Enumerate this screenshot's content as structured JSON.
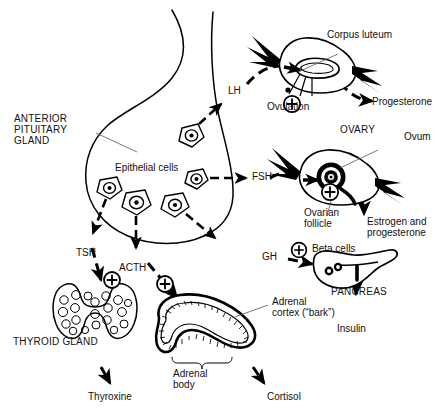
{
  "figure": {
    "type": "biological-flow-diagram",
    "background_color": "#ffffff",
    "ink_color": "#000000"
  },
  "labels": {
    "anterior_pituitary": "ANTERIOR\nPITUITARY\nGLAND",
    "epithelial_cells": "Epithelial cells",
    "lh": "LH",
    "fsh": "FSH",
    "gh": "GH",
    "tsh": "TSH",
    "acth": "ACTH",
    "corpus_luteum": "Corpus luteum",
    "ovulation": "Ovulation",
    "progesterone": "Progesterone",
    "ovary": "OVARY",
    "ovum": "Ovum",
    "ovarian_follicle": "Ovarian\nfollicle",
    "estrogen_and_progesterone": "Estrogen and\nprogesterone",
    "beta_cells": "Beta cells",
    "pancreas": "PANCREAS",
    "insulin": "Insulin",
    "thyroid_gland": "THYROID GLAND",
    "thyroxine": "Thyroxine",
    "adrenal_cortex": "Adrenal\ncortex (“bark”)",
    "adrenal_body": "Adrenal\nbody",
    "cortisol": "Cortisol",
    "plus_sign": "+"
  },
  "hormones": [
    {
      "name": "LH",
      "target": "Corpus luteum / ovary",
      "product": "Progesterone"
    },
    {
      "name": "FSH",
      "target": "Ovarian follicle / ovary",
      "product": "Estrogen and progesterone"
    },
    {
      "name": "GH",
      "target": "Beta cells / pancreas",
      "product": "Insulin"
    },
    {
      "name": "TSH",
      "target": "Thyroid gland",
      "product": "Thyroxine"
    },
    {
      "name": "ACTH",
      "target": "Adrenal body",
      "product": "Cortisol"
    }
  ],
  "stimulation_markers": [
    {
      "for": "LH",
      "symbol": "+"
    },
    {
      "for": "FSH",
      "symbol": "+"
    },
    {
      "for": "GH",
      "symbol": "+"
    },
    {
      "for": "TSH",
      "symbol": "+"
    },
    {
      "for": "ACTH",
      "symbol": "+"
    }
  ]
}
